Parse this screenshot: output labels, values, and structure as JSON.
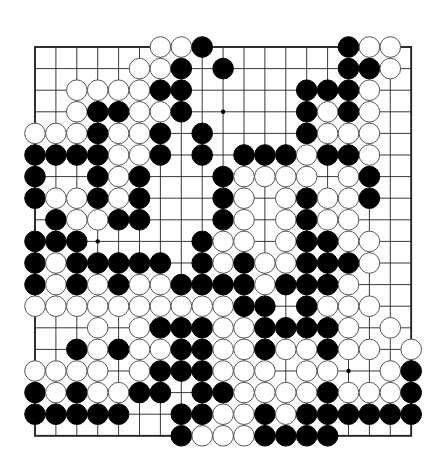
{
  "board": {
    "size": 19,
    "origin_x": 35,
    "origin_y": 47,
    "spacing_x": 20.9,
    "spacing_y": 21.6,
    "stone_radius": 10.3,
    "colors": {
      "black": "#000000",
      "white": "#ffffff",
      "line": "#222222",
      "background": "#ffffff"
    },
    "star_points": [
      [
        9,
        3
      ],
      [
        3,
        9
      ],
      [
        15,
        15
      ]
    ],
    "rows": [
      "......WWB......BWW.",
      ".....WWB.B.....BBW.",
      "..WWWWBB.....BBBW..",
      "..WBBWWB.....BWBW..",
      "WWWBWWB.B....BWWW..",
      "BBBBWWB.B.BBBWBBW..",
      "B..BWB...BWWWW.WB..",
      "BWWBWB...BW.WBWWB..",
      ".BWWBB...BW.WBWW...",
      "BBB.....BWW.WBBWW..",
      "BWBBBBB.BWBWWBBBW..",
      "BWBWBWWBBBBWBBBW...",
      "WWWWWWWWWWBB.BWWW..",
      "...W.WBBBWWBBBBW.W.",
      "..BWBWWBBWWBWWBWW.W",
      "WWWW.WBBBWWW.WW..WB",
      "BWBWWBB.BBWWWWBWWWB",
      "BBBBB..BBWWBWBBBBBB",
      ".......BWWWBBBB...."
    ]
  }
}
